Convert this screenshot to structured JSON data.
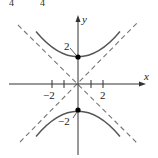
{
  "figure": {
    "top_fragment": [
      "4",
      "4"
    ],
    "axes": {
      "x_label": "x",
      "y_label": "y",
      "x_tick_labels": [
        "−2",
        "2"
      ],
      "x_ticks": [
        -2,
        -1,
        1,
        2
      ]
    },
    "vertices": [
      {
        "label": "2",
        "x": 0,
        "y": 2
      },
      {
        "label": "−2",
        "x": 0,
        "y": -2
      }
    ],
    "asymptotes": [
      "y = x",
      "y = -x"
    ],
    "colors": {
      "curve": "#555555",
      "asymptote": "#777777",
      "axis": "#333333",
      "point": "#000000"
    }
  }
}
